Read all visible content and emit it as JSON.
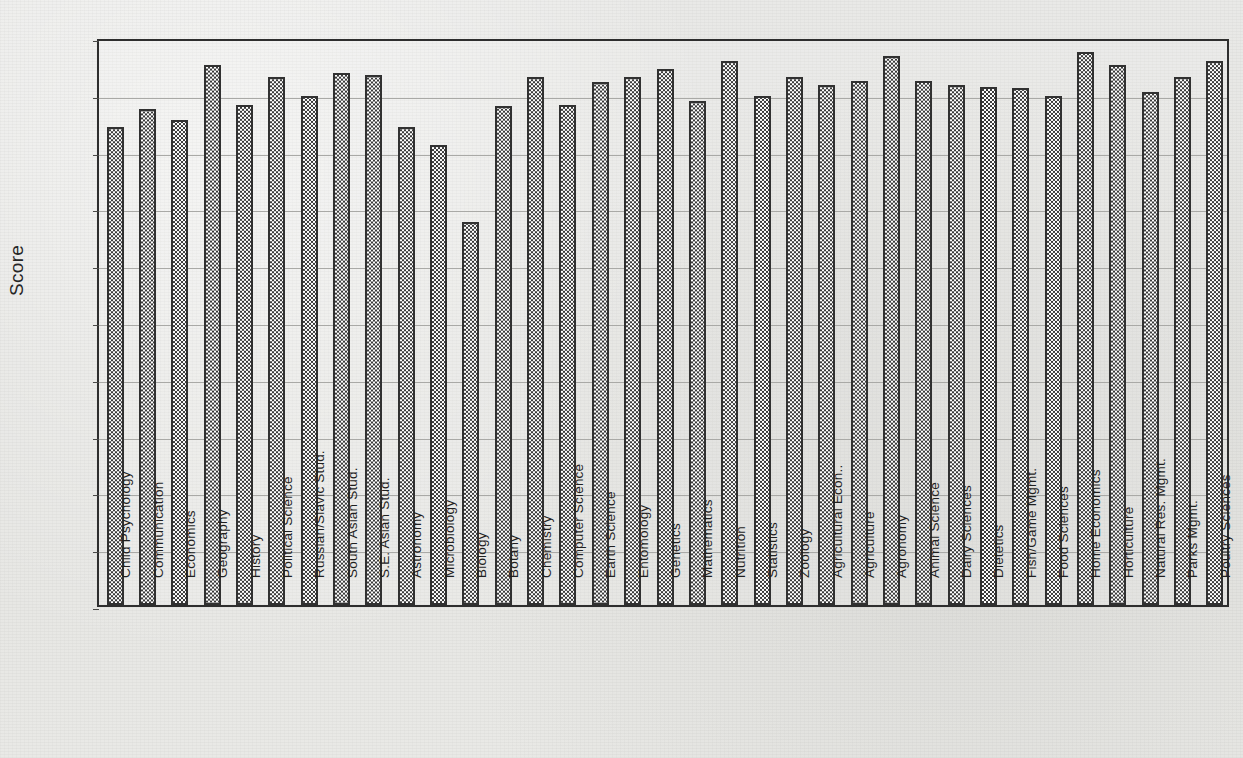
{
  "chart_data": {
    "type": "bar",
    "title": "",
    "xlabel": "",
    "ylabel": "Score",
    "ylim": [
      0,
      5
    ],
    "ytick_step": 0.5,
    "grid": true,
    "legend": false,
    "ytick_labels": [
      "5.00",
      "4.50",
      "4.00",
      "3.50",
      "3.00",
      "2.50",
      "2.00",
      "1.50",
      "1.00",
      "0.50",
      "0.00"
    ],
    "ytick_values": [
      5.0,
      4.5,
      4.0,
      3.5,
      3.0,
      2.5,
      2.0,
      1.5,
      1.0,
      0.5,
      0.0
    ],
    "categories": [
      "Child Psychology",
      "Communication",
      "Economics",
      "Geography",
      "History",
      "Political  Science",
      "Russian/Slavic Stud.",
      "South Asian Stud.",
      "S.E. Asian Stud.",
      "Astronomy",
      "Microbiology",
      "Biology",
      "Botany",
      "Chemistry",
      "Computer Science",
      "Earth Science",
      "Entomology",
      "Genetics",
      "Mathematics",
      "Nutrition",
      "Statistics",
      "Zoology",
      "Agricultural Econ..",
      "Agriculture",
      "Agronomy",
      "Animal Science",
      "Dairy Sciences",
      "Dietetics",
      "Fish/Game Mgmt.",
      "Food Sciences",
      "Home Economics",
      "Horticulture",
      "Natural Res. Mgmt.",
      "Parks Mgmt.",
      "Poultry Sciences"
    ],
    "values": [
      4.21,
      4.37,
      4.27,
      4.75,
      4.4,
      4.65,
      4.48,
      4.68,
      4.67,
      4.21,
      4.05,
      3.37,
      4.39,
      4.65,
      4.4,
      4.6,
      4.65,
      4.72,
      4.44,
      4.79,
      4.48,
      4.65,
      4.58,
      4.61,
      4.83,
      4.61,
      4.58,
      4.56,
      4.55,
      4.48,
      4.87,
      4.75,
      4.52,
      4.65,
      4.79
    ]
  },
  "colors": {
    "axis": "#2e2e2e",
    "grid": "#a9a9a6",
    "bar_border": "#313131",
    "text": "#1f1f1f",
    "background": "#e8e8e6"
  }
}
